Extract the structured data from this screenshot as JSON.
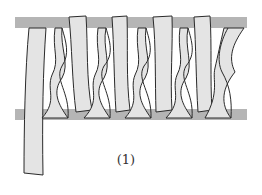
{
  "diagram": {
    "caption": "(1)",
    "colors": {
      "bar": "#b5b5b5",
      "strip_fill": "#e4e4e4",
      "strip_stroke": "#2a2a2a",
      "background": "#ffffff"
    },
    "bars": [
      {
        "name": "top-bar",
        "y": 17,
        "height": 11
      },
      {
        "name": "bottom-bar",
        "y": 109,
        "height": 11
      }
    ],
    "strip_count": 6,
    "twist_count": 5
  }
}
